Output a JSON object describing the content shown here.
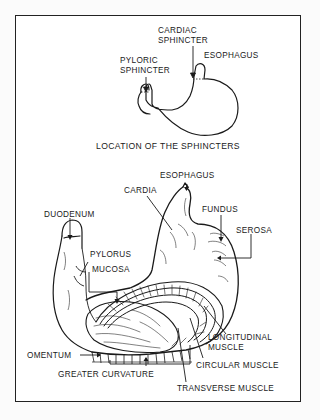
{
  "figure": {
    "top_diagram": {
      "caption": "LOCATION OF THE SPHINCTERS",
      "labels": {
        "cardiac_sphincter_line1": "CARDIAC",
        "cardiac_sphincter_line2": "SPHINCTER",
        "pyloric_sphincter_line1": "PYLORIC",
        "pyloric_sphincter_line2": "SPHINCTER",
        "esophagus": "ESOPHAGUS"
      }
    },
    "bottom_diagram": {
      "labels": {
        "esophagus": "ESOPHAGUS",
        "cardia": "CARDIA",
        "fundus": "FUNDUS",
        "serosa": "SEROSA",
        "duodenum": "DUODENUM",
        "pylorus": "PYLORUS",
        "mucosa": "MUCOSA",
        "longitudinal_muscle_line1": "LONGITUDINAL",
        "longitudinal_muscle_line2": "MUSCLE",
        "circular_muscle": "CIRCULAR MUSCLE",
        "omentum": "OMENTUM",
        "greater_curvature": "GREATER CURVATURE",
        "transverse_muscle": "TRANSVERSE MUSCLE"
      }
    },
    "colors": {
      "ink": "#1a1a1a",
      "paper": "#ffffff",
      "border": "#222222"
    }
  }
}
